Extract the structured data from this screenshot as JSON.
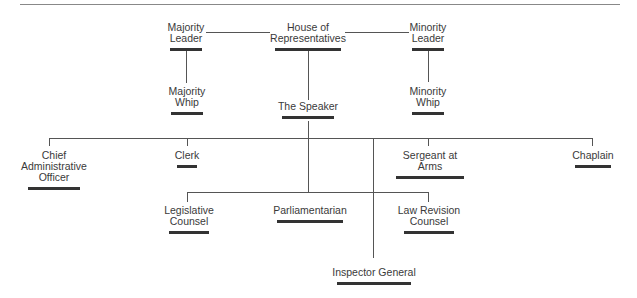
{
  "diagram": {
    "nodes": [
      {
        "id": "house",
        "label": "House of\nRepresentatives"
      },
      {
        "id": "majority_leader",
        "label": "Majority\nLeader"
      },
      {
        "id": "minority_leader",
        "label": "Minority\nLeader"
      },
      {
        "id": "majority_whip",
        "label": "Majority\nWhip"
      },
      {
        "id": "minority_whip",
        "label": "Minority\nWhip"
      },
      {
        "id": "speaker",
        "label": "The Speaker"
      },
      {
        "id": "cao",
        "label": "Chief\nAdministrative\nOfficer"
      },
      {
        "id": "clerk",
        "label": "Clerk"
      },
      {
        "id": "sergeant",
        "label": "Sergeant at Arms"
      },
      {
        "id": "chaplain",
        "label": "Chaplain"
      },
      {
        "id": "legislative_counsel",
        "label": "Legislative\nCounsel"
      },
      {
        "id": "parliamentarian",
        "label": "Parliamentarian"
      },
      {
        "id": "law_revision",
        "label": "Law Revision\nCounsel"
      },
      {
        "id": "inspector_general",
        "label": "Inspector General"
      }
    ],
    "edges": [
      [
        "house",
        "majority_leader"
      ],
      [
        "house",
        "minority_leader"
      ],
      [
        "majority_leader",
        "majority_whip"
      ],
      [
        "minority_leader",
        "minority_whip"
      ],
      [
        "house",
        "speaker"
      ],
      [
        "speaker",
        "cao"
      ],
      [
        "speaker",
        "clerk"
      ],
      [
        "speaker",
        "sergeant"
      ],
      [
        "speaker",
        "chaplain"
      ],
      [
        "speaker",
        "inspector_general"
      ],
      [
        "speaker",
        "legislative_counsel"
      ],
      [
        "speaker",
        "parliamentarian"
      ],
      [
        "speaker",
        "law_revision"
      ]
    ]
  }
}
